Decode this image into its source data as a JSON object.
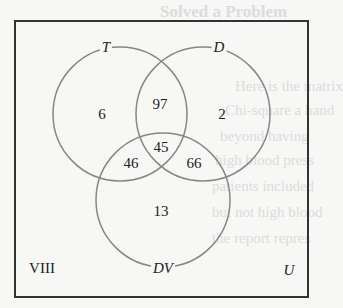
{
  "diagram": {
    "type": "venn",
    "universe_label": "U",
    "figure_label": "VIII",
    "sets": [
      {
        "name": "T",
        "label": "T"
      },
      {
        "name": "D",
        "label": "D"
      },
      {
        "name": "DV",
        "label": "DV"
      }
    ],
    "regions": {
      "T_only": "6",
      "D_only": "2",
      "DV_only": "13",
      "T_and_D_only": "97",
      "T_and_DV_only": "46",
      "D_and_DV_only": "66",
      "T_and_D_and_DV": "45"
    },
    "colors": {
      "circle": "#888888",
      "box": "#333333",
      "text": "#222222"
    }
  },
  "background_text": [
    "Solved a Problem",
    "Here is the matrix",
    "Chi-square a hand",
    "beyond having",
    "high blood press",
    "patients included",
    "but not high blood",
    "the report repres"
  ]
}
